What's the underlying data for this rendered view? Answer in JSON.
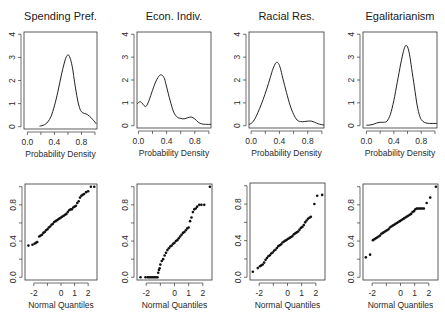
{
  "chart_data": [
    {
      "type": "line",
      "panel": "top-1",
      "title": "Spending Pref.",
      "xlabel": "Probability Density",
      "ylabel": "",
      "xlim": [
        -0.05,
        1.03
      ],
      "ylim": [
        -0.1,
        4.1
      ],
      "xticks": [
        0.0,
        0.2,
        0.4,
        0.6,
        0.8,
        1.0
      ],
      "xtick_labels": [
        "0.0",
        "",
        "0.4",
        "",
        "0.8",
        ""
      ],
      "yticks": [
        0,
        1,
        2,
        3,
        4
      ],
      "ytick_labels": [
        "0",
        "1",
        "2",
        "3",
        "4"
      ],
      "x": [
        0.18,
        0.25,
        0.3,
        0.35,
        0.4,
        0.45,
        0.5,
        0.55,
        0.58,
        0.61,
        0.64,
        0.67,
        0.7,
        0.74,
        0.78,
        0.82,
        0.87,
        0.92,
        0.97,
        1.02
      ],
      "y": [
        0.02,
        0.08,
        0.2,
        0.45,
        0.9,
        1.5,
        2.2,
        2.8,
        3.05,
        3.1,
        2.9,
        2.5,
        1.9,
        1.2,
        0.75,
        0.6,
        0.55,
        0.45,
        0.3,
        0.12
      ]
    },
    {
      "type": "line",
      "panel": "top-2",
      "title": "Econ. Indiv.",
      "xlabel": "Probability Density",
      "ylabel": "",
      "xlim": [
        -0.02,
        1.03
      ],
      "ylim": [
        -0.1,
        4.1
      ],
      "xticks": [
        0.0,
        0.2,
        0.4,
        0.6,
        0.8,
        1.0
      ],
      "xtick_labels": [
        "0.0",
        "",
        "0.4",
        "",
        "0.8",
        ""
      ],
      "yticks": [
        0,
        1,
        2,
        3,
        4
      ],
      "ytick_labels": [
        "0",
        "1",
        "2",
        "3",
        "4"
      ],
      "x": [
        -0.02,
        0.02,
        0.05,
        0.08,
        0.11,
        0.15,
        0.2,
        0.25,
        0.3,
        0.34,
        0.37,
        0.4,
        0.45,
        0.5,
        0.55,
        0.6,
        0.65,
        0.7,
        0.75,
        0.8,
        0.85,
        0.9,
        0.95,
        1.03
      ],
      "y": [
        0.95,
        1.05,
        1.0,
        0.88,
        0.85,
        1.1,
        1.55,
        1.95,
        2.2,
        2.2,
        2.05,
        1.7,
        1.1,
        0.6,
        0.38,
        0.32,
        0.3,
        0.35,
        0.38,
        0.3,
        0.15,
        0.08,
        0.06,
        0.06
      ]
    },
    {
      "type": "line",
      "panel": "top-3",
      "title": "Racial Res.",
      "xlabel": "Probability Density",
      "ylabel": "",
      "xlim": [
        -0.03,
        1.03
      ],
      "ylim": [
        -0.1,
        4.1
      ],
      "xticks": [
        0.0,
        0.2,
        0.4,
        0.6,
        0.8,
        1.0
      ],
      "xtick_labels": [
        "0.0",
        "",
        "0.4",
        "",
        "0.8",
        ""
      ],
      "yticks": [
        0,
        1,
        2,
        3,
        4
      ],
      "ytick_labels": [
        "0",
        "1",
        "2",
        "3",
        "4"
      ],
      "x": [
        -0.03,
        0.02,
        0.07,
        0.12,
        0.17,
        0.22,
        0.27,
        0.31,
        0.35,
        0.38,
        0.41,
        0.45,
        0.5,
        0.55,
        0.6,
        0.65,
        0.7,
        0.75,
        0.8,
        0.85,
        0.9,
        0.95,
        1.03
      ],
      "y": [
        0.05,
        0.15,
        0.4,
        0.75,
        1.15,
        1.6,
        2.1,
        2.5,
        2.75,
        2.75,
        2.55,
        2.05,
        1.45,
        0.9,
        0.5,
        0.25,
        0.18,
        0.18,
        0.2,
        0.2,
        0.15,
        0.08,
        0.03
      ]
    },
    {
      "type": "line",
      "panel": "top-4",
      "title": "Egalitarianism",
      "xlabel": "Probability Density",
      "ylabel": "",
      "xlim": [
        -0.05,
        1.03
      ],
      "ylim": [
        -0.1,
        4.1
      ],
      "xticks": [
        0.0,
        0.2,
        0.4,
        0.6,
        0.8,
        1.0
      ],
      "xtick_labels": [
        "0.0",
        "",
        "0.4",
        "",
        "0.8",
        ""
      ],
      "yticks": [
        0,
        1,
        2,
        3,
        4
      ],
      "ytick_labels": [
        "0",
        "1",
        "2",
        "3",
        "4"
      ],
      "x": [
        0.0,
        0.05,
        0.1,
        0.15,
        0.2,
        0.25,
        0.3,
        0.35,
        0.4,
        0.45,
        0.5,
        0.54,
        0.57,
        0.6,
        0.63,
        0.66,
        0.7,
        0.74,
        0.78,
        0.82,
        0.87,
        0.92,
        0.97,
        1.03
      ],
      "y": [
        0.02,
        0.03,
        0.06,
        0.12,
        0.15,
        0.15,
        0.2,
        0.5,
        1.1,
        1.9,
        2.7,
        3.25,
        3.5,
        3.45,
        3.1,
        2.5,
        1.7,
        0.9,
        0.4,
        0.2,
        0.12,
        0.1,
        0.1,
        0.1
      ]
    },
    {
      "type": "scatter",
      "panel": "bottom-1",
      "title": "",
      "xlabel": "Normal Quantiles",
      "ylabel": "",
      "xlim": [
        -2.65,
        2.65
      ],
      "ylim": [
        -0.03,
        1.03
      ],
      "xticks": [
        -2,
        -1,
        0,
        1,
        2
      ],
      "xtick_labels": [
        "-2",
        "",
        "0",
        "1",
        "2"
      ],
      "yticks": [
        0.0,
        0.2,
        0.4,
        0.6,
        0.8,
        1.0
      ],
      "ytick_labels": [
        "0.0",
        "",
        "0.4",
        "",
        "0.8",
        ""
      ],
      "x": [
        -2.4,
        -2.1,
        -1.95,
        -1.85,
        -1.75,
        -1.6,
        -1.5,
        -1.4,
        -1.3,
        -1.2,
        -1.1,
        -1.0,
        -0.9,
        -0.8,
        -0.7,
        -0.6,
        -0.5,
        -0.4,
        -0.3,
        -0.2,
        -0.1,
        0.0,
        0.1,
        0.2,
        0.3,
        0.4,
        0.5,
        0.6,
        0.7,
        0.8,
        0.9,
        1.0,
        1.1,
        1.2,
        1.3,
        1.4,
        1.5,
        1.6,
        1.7,
        1.85,
        2.0,
        2.2,
        2.45
      ],
      "y": [
        0.35,
        0.36,
        0.37,
        0.38,
        0.39,
        0.45,
        0.46,
        0.47,
        0.49,
        0.5,
        0.52,
        0.53,
        0.55,
        0.56,
        0.58,
        0.59,
        0.61,
        0.62,
        0.63,
        0.64,
        0.65,
        0.66,
        0.67,
        0.68,
        0.69,
        0.7,
        0.72,
        0.74,
        0.75,
        0.75,
        0.77,
        0.78,
        0.79,
        0.82,
        0.84,
        0.88,
        0.9,
        0.91,
        0.92,
        0.94,
        0.95,
        1.0,
        1.0
      ]
    },
    {
      "type": "scatter",
      "panel": "bottom-2",
      "title": "",
      "xlabel": "Normal Quantiles",
      "ylabel": "",
      "xlim": [
        -2.65,
        2.65
      ],
      "ylim": [
        -0.03,
        1.03
      ],
      "xticks": [
        -2,
        -1,
        0,
        1,
        2
      ],
      "xtick_labels": [
        "-2",
        "",
        "0",
        "1",
        "2"
      ],
      "yticks": [
        0.0,
        0.2,
        0.4,
        0.6,
        0.8,
        1.0
      ],
      "ytick_labels": [
        "0.0",
        "",
        "0.4",
        "",
        "0.8",
        ""
      ],
      "x": [
        -2.4,
        -2.05,
        -1.9,
        -1.8,
        -1.7,
        -1.6,
        -1.5,
        -1.4,
        -1.3,
        -1.2,
        -1.15,
        -1.1,
        -1.05,
        -1.0,
        -0.9,
        -0.8,
        -0.7,
        -0.6,
        -0.5,
        -0.4,
        -0.3,
        -0.2,
        -0.1,
        0.0,
        0.1,
        0.2,
        0.3,
        0.4,
        0.5,
        0.6,
        0.7,
        0.8,
        0.9,
        1.0,
        1.1,
        1.2,
        1.3,
        1.4,
        1.5,
        1.6,
        1.75,
        1.9,
        2.1,
        2.5
      ],
      "y": [
        0.0,
        0.0,
        0.0,
        0.0,
        0.0,
        0.0,
        0.0,
        0.0,
        0.0,
        0.0,
        0.05,
        0.08,
        0.1,
        0.14,
        0.18,
        0.2,
        0.24,
        0.27,
        0.3,
        0.32,
        0.34,
        0.35,
        0.37,
        0.38,
        0.4,
        0.41,
        0.43,
        0.45,
        0.47,
        0.49,
        0.5,
        0.52,
        0.54,
        0.55,
        0.62,
        0.66,
        0.72,
        0.75,
        0.76,
        0.78,
        0.8,
        0.8,
        0.8,
        1.0
      ]
    },
    {
      "type": "scatter",
      "panel": "bottom-3",
      "title": "",
      "xlabel": "Normal Quantiles",
      "ylabel": "",
      "xlim": [
        -2.65,
        2.65
      ],
      "ylim": [
        -0.03,
        1.03
      ],
      "xticks": [
        -2,
        -1,
        0,
        1,
        2
      ],
      "xtick_labels": [
        "-2",
        "",
        "0",
        "1",
        "2"
      ],
      "yticks": [
        0.0,
        0.2,
        0.4,
        0.6,
        0.8,
        1.0
      ],
      "ytick_labels": [
        "0.0",
        "",
        "0.4",
        "",
        "0.8",
        ""
      ],
      "x": [
        -2.45,
        -2.1,
        -1.95,
        -1.85,
        -1.75,
        -1.65,
        -1.55,
        -1.45,
        -1.35,
        -1.25,
        -1.15,
        -1.05,
        -0.95,
        -0.85,
        -0.75,
        -0.65,
        -0.55,
        -0.45,
        -0.35,
        -0.25,
        -0.15,
        -0.05,
        0.05,
        0.15,
        0.25,
        0.35,
        0.45,
        0.55,
        0.65,
        0.75,
        0.85,
        0.95,
        1.05,
        1.15,
        1.25,
        1.35,
        1.45,
        1.55,
        1.65,
        1.9,
        2.1,
        2.45
      ],
      "y": [
        0.06,
        0.1,
        0.12,
        0.13,
        0.14,
        0.16,
        0.19,
        0.21,
        0.23,
        0.24,
        0.26,
        0.27,
        0.29,
        0.3,
        0.32,
        0.34,
        0.35,
        0.36,
        0.38,
        0.39,
        0.4,
        0.41,
        0.42,
        0.43,
        0.44,
        0.45,
        0.47,
        0.48,
        0.49,
        0.5,
        0.52,
        0.54,
        0.55,
        0.57,
        0.6,
        0.62,
        0.64,
        0.65,
        0.66,
        0.8,
        0.89,
        0.9
      ]
    },
    {
      "type": "scatter",
      "panel": "bottom-4",
      "title": "",
      "xlabel": "Normal Quantiles",
      "ylabel": "",
      "xlim": [
        -2.65,
        2.65
      ],
      "ylim": [
        -0.03,
        1.03
      ],
      "xticks": [
        -2,
        -1,
        0,
        1,
        2
      ],
      "xtick_labels": [
        "-2",
        "",
        "0",
        "1",
        "2"
      ],
      "yticks": [
        0.0,
        0.2,
        0.4,
        0.6,
        0.8,
        1.0
      ],
      "ytick_labels": [
        "0.0",
        "",
        "0.4",
        "",
        "0.8",
        ""
      ],
      "x": [
        -2.45,
        -2.15,
        -1.95,
        -1.85,
        -1.75,
        -1.65,
        -1.55,
        -1.45,
        -1.35,
        -1.25,
        -1.15,
        -1.05,
        -0.95,
        -0.85,
        -0.75,
        -0.65,
        -0.55,
        -0.45,
        -0.35,
        -0.25,
        -0.15,
        -0.05,
        0.05,
        0.15,
        0.25,
        0.35,
        0.45,
        0.55,
        0.65,
        0.75,
        0.85,
        0.95,
        1.05,
        1.15,
        1.25,
        1.35,
        1.45,
        1.55,
        1.65,
        1.85,
        2.1,
        2.5
      ],
      "y": [
        0.22,
        0.25,
        0.41,
        0.42,
        0.43,
        0.44,
        0.45,
        0.46,
        0.48,
        0.49,
        0.5,
        0.51,
        0.52,
        0.53,
        0.55,
        0.56,
        0.57,
        0.58,
        0.59,
        0.6,
        0.61,
        0.62,
        0.63,
        0.64,
        0.65,
        0.66,
        0.67,
        0.68,
        0.69,
        0.7,
        0.72,
        0.73,
        0.75,
        0.76,
        0.76,
        0.76,
        0.76,
        0.76,
        0.76,
        0.82,
        0.88,
        1.0
      ]
    }
  ],
  "layout": {
    "panels": [
      {
        "box": [
          24,
          32,
          97,
          129
        ],
        "title_y": 20
      },
      {
        "box": [
          137,
          32,
          211,
          128
        ],
        "title_y": 20
      },
      {
        "box": [
          249,
          32,
          324,
          128
        ],
        "title_y": 20
      },
      {
        "box": [
          363,
          32,
          437,
          128
        ],
        "title_y": 20
      },
      {
        "box": [
          25,
          184,
          97,
          280
        ]
      },
      {
        "box": [
          137,
          184,
          212,
          280
        ]
      },
      {
        "box": [
          250,
          183,
          325,
          280
        ]
      },
      {
        "box": [
          363,
          184,
          438,
          280
        ]
      }
    ]
  }
}
